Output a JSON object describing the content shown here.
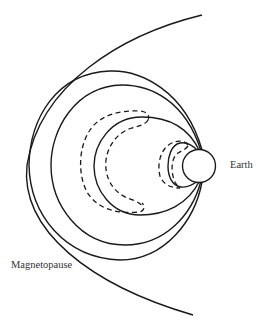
{
  "diagram": {
    "type": "magnetosphere field lines",
    "labels": {
      "earth": "Earth",
      "magnetopause": "Magnetopause"
    },
    "elements": {
      "magnetopause": "open boundary curve",
      "closed_field_lines_solid": 4,
      "dashed_field_line_pairs": 2,
      "earth": "circle"
    },
    "colors": {
      "stroke": "#1a1a1a",
      "background": "#ffffff",
      "text": "#333333"
    }
  }
}
